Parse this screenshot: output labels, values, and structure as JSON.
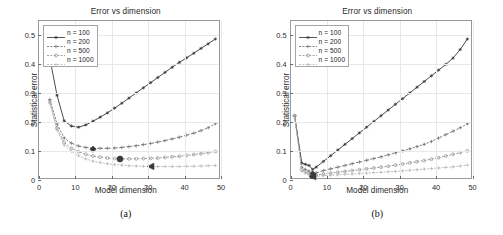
{
  "figure": {
    "panels": [
      {
        "id": "a",
        "caption": "(a)",
        "title": "Error vs dimension",
        "xlabel": "Model dimension",
        "ylabel": "Statistical error"
      },
      {
        "id": "b",
        "caption": "(b)",
        "title": "Error vs dimension",
        "xlabel": "Model dimension",
        "ylabel": "Statistical error"
      }
    ]
  },
  "colors": {
    "series_100": "#2b2b2b",
    "series_200": "#636363",
    "series_500": "#8f8f8f",
    "series_1000": "#b4b4b4",
    "grid": "#e8e8e8",
    "axis": "#9a9a9a",
    "background": "#ffffff"
  },
  "chart_data": [
    {
      "type": "line",
      "panel": "a",
      "title": "Error vs dimension",
      "xlabel": "Model dimension",
      "ylabel": "Statistical error",
      "xlim": [
        0,
        50
      ],
      "ylim": [
        0,
        0.55
      ],
      "xticks": [
        0,
        10,
        20,
        30,
        40,
        50
      ],
      "yticks": [
        0,
        0.1,
        0.2,
        0.3,
        0.4,
        0.5
      ],
      "ytick_labels": [
        "0",
        "0.1",
        "0.2",
        "0.3",
        "0.4",
        "0.5"
      ],
      "xtick_labels": [
        "0",
        "10",
        "20",
        "30",
        "40",
        "50"
      ],
      "grid": true,
      "legend_position": "upper-left",
      "x": [
        3,
        5,
        7,
        9,
        11,
        13,
        15,
        17,
        19,
        21,
        23,
        25,
        27,
        29,
        31,
        33,
        35,
        37,
        39,
        41,
        43,
        45,
        47,
        49
      ],
      "series": [
        {
          "name": "n = 100",
          "marker": "star",
          "color": "#2b2b2b",
          "values": [
            0.42,
            0.29,
            0.2,
            0.182,
            0.178,
            0.186,
            0.199,
            0.213,
            0.228,
            0.245,
            0.262,
            0.28,
            0.298,
            0.316,
            0.334,
            0.352,
            0.37,
            0.388,
            0.405,
            0.421,
            0.437,
            0.454,
            0.47,
            0.487
          ],
          "minimum_marker": {
            "x": 10.5,
            "y": 0.177,
            "shape": "none"
          }
        },
        {
          "name": "n = 200",
          "marker": "plus",
          "color": "#636363",
          "values": [
            0.275,
            0.19,
            0.14,
            0.122,
            0.112,
            0.107,
            0.104,
            0.104,
            0.104,
            0.105,
            0.107,
            0.11,
            0.113,
            0.117,
            0.121,
            0.126,
            0.131,
            0.137,
            0.143,
            0.15,
            0.157,
            0.166,
            0.176,
            0.19
          ],
          "minimum_marker": {
            "x": 15,
            "y": 0.101,
            "shape": "diamond"
          }
        },
        {
          "name": "n = 500",
          "marker": "circle",
          "color": "#8f8f8f",
          "values": [
            0.268,
            0.175,
            0.124,
            0.104,
            0.092,
            0.083,
            0.077,
            0.073,
            0.07,
            0.068,
            0.067,
            0.067,
            0.067,
            0.068,
            0.069,
            0.07,
            0.072,
            0.074,
            0.076,
            0.079,
            0.082,
            0.085,
            0.089,
            0.093
          ],
          "minimum_marker": {
            "x": 22.5,
            "y": 0.0665,
            "shape": "circle"
          }
        },
        {
          "name": "n = 1000",
          "marker": "plus",
          "color": "#b4b4b4",
          "values": [
            0.262,
            0.168,
            0.115,
            0.093,
            0.078,
            0.067,
            0.059,
            0.054,
            0.05,
            0.047,
            0.045,
            0.043,
            0.042,
            0.041,
            0.04,
            0.04,
            0.04,
            0.04,
            0.04,
            0.041,
            0.041,
            0.042,
            0.043,
            0.044
          ],
          "minimum_marker": {
            "x": 31,
            "y": 0.0405,
            "shape": "triangle-left"
          }
        }
      ]
    },
    {
      "type": "line",
      "panel": "b",
      "title": "Error vs dimension",
      "xlabel": "Model dimension",
      "ylabel": "Statistical error",
      "xlim": [
        0,
        50
      ],
      "ylim": [
        0,
        0.55
      ],
      "xticks": [
        0,
        10,
        20,
        30,
        40,
        50
      ],
      "yticks": [
        0,
        0.1,
        0.2,
        0.3,
        0.4,
        0.5
      ],
      "ytick_labels": [
        "0",
        "0.1",
        "0.2",
        "0.3",
        "0.4",
        "0.5"
      ],
      "xtick_labels": [
        "0",
        "10",
        "20",
        "30",
        "40",
        "50"
      ],
      "grid": true,
      "legend_position": "upper-left",
      "x": [
        1,
        3,
        4,
        5,
        6,
        7,
        9,
        11,
        13,
        15,
        17,
        19,
        21,
        23,
        25,
        27,
        29,
        31,
        33,
        35,
        37,
        39,
        41,
        43,
        45,
        47,
        49
      ],
      "series": [
        {
          "name": "n = 100",
          "marker": "star",
          "color": "#2b2b2b",
          "values": [
            0.218,
            0.052,
            0.048,
            0.044,
            0.03,
            0.038,
            0.058,
            0.078,
            0.098,
            0.118,
            0.138,
            0.158,
            0.178,
            0.198,
            0.218,
            0.238,
            0.258,
            0.278,
            0.298,
            0.318,
            0.338,
            0.358,
            0.378,
            0.398,
            0.42,
            0.45,
            0.487
          ],
          "minimum_marker": {
            "x": 6,
            "y": 0.03,
            "shape": "none"
          }
        },
        {
          "name": "n = 200",
          "marker": "plus",
          "color": "#636363",
          "values": [
            0.218,
            0.038,
            0.03,
            0.024,
            0.014,
            0.018,
            0.026,
            0.032,
            0.038,
            0.044,
            0.05,
            0.056,
            0.062,
            0.068,
            0.074,
            0.081,
            0.088,
            0.095,
            0.102,
            0.11,
            0.118,
            0.128,
            0.14,
            0.152,
            0.164,
            0.176,
            0.19
          ],
          "minimum_marker": {
            "x": 6,
            "y": 0.014,
            "shape": "diamond"
          }
        },
        {
          "name": "n = 500",
          "marker": "circle",
          "color": "#8f8f8f",
          "values": [
            0.218,
            0.03,
            0.022,
            0.016,
            0.008,
            0.01,
            0.014,
            0.017,
            0.02,
            0.023,
            0.026,
            0.029,
            0.032,
            0.035,
            0.038,
            0.041,
            0.045,
            0.049,
            0.053,
            0.057,
            0.061,
            0.066,
            0.071,
            0.077,
            0.083,
            0.089,
            0.095
          ],
          "minimum_marker": {
            "x": 6,
            "y": 0.008,
            "shape": "circle"
          }
        },
        {
          "name": "n = 1000",
          "marker": "plus",
          "color": "#b4b4b4",
          "values": [
            0.218,
            0.024,
            0.017,
            0.012,
            0.005,
            0.006,
            0.008,
            0.01,
            0.011,
            0.013,
            0.014,
            0.016,
            0.017,
            0.019,
            0.02,
            0.022,
            0.023,
            0.025,
            0.027,
            0.029,
            0.031,
            0.033,
            0.035,
            0.037,
            0.039,
            0.042,
            0.045
          ],
          "minimum_marker": {
            "x": 6,
            "y": 0.005,
            "shape": "triangle-left"
          }
        }
      ]
    }
  ]
}
